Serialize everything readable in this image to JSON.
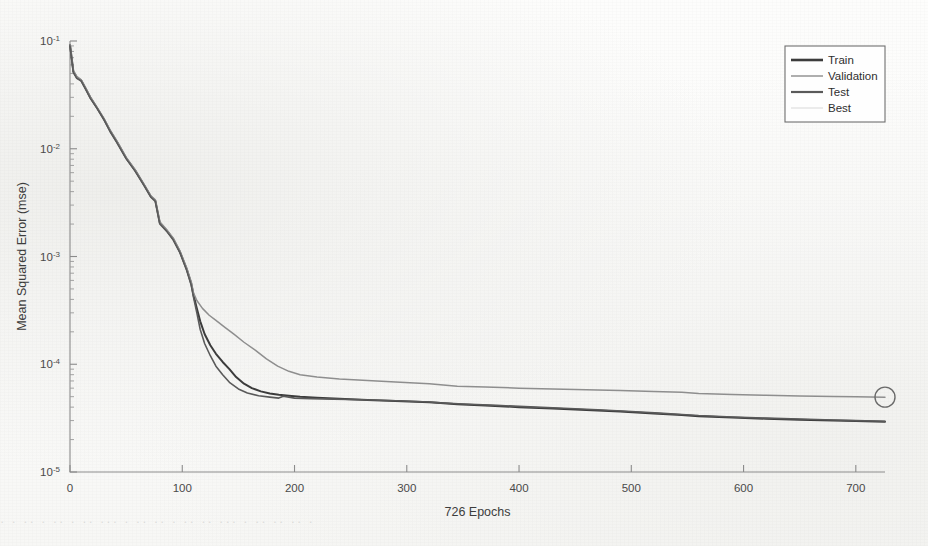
{
  "figure": {
    "kind": "training-performance-plot",
    "background_color": "#fdfdfc"
  },
  "chart_data": {
    "type": "line",
    "title": "",
    "xlabel": "726 Epochs",
    "ylabel": "Mean Squared Error  (mse)",
    "yscale": "log",
    "xscale": "linear",
    "xlim": [
      0,
      726
    ],
    "ylim": [
      1e-05,
      0.1
    ],
    "grid": false,
    "legend_position": "top-right",
    "xticks": [
      0,
      100,
      200,
      300,
      400,
      500,
      600,
      700
    ],
    "xticklabels": [
      "0",
      "100",
      "200",
      "300",
      "400",
      "500",
      "600",
      "700"
    ],
    "yticks": [
      1e-05,
      0.0001,
      0.001,
      0.01,
      0.1
    ],
    "yticklabels": [
      "10-5",
      "10-4",
      "10-3",
      "10-2",
      "10-1"
    ],
    "ytick_mantissas": [
      "10",
      "10",
      "10",
      "10",
      "10"
    ],
    "ytick_exponents": [
      "-5",
      "-4",
      "-3",
      "-2",
      "-1"
    ],
    "series": [
      {
        "name": "Train",
        "color": "#3c3c3c",
        "width": 2.0,
        "x": [
          0,
          3,
          6,
          10,
          14,
          18,
          24,
          30,
          36,
          42,
          50,
          58,
          66,
          72,
          76,
          80,
          86,
          92,
          98,
          104,
          108,
          110,
          113,
          116,
          120,
          125,
          130,
          136,
          142,
          148,
          155,
          162,
          170,
          178,
          186,
          195,
          205,
          220,
          240,
          265,
          290,
          320,
          330,
          345,
          370,
          400,
          430,
          460,
          490,
          520,
          545,
          560,
          590,
          620,
          650,
          680,
          700,
          726
        ],
        "y": [
          0.092,
          0.052,
          0.046,
          0.043,
          0.036,
          0.03,
          0.024,
          0.019,
          0.0145,
          0.0115,
          0.0082,
          0.0063,
          0.0046,
          0.0036,
          0.0033,
          0.00205,
          0.00175,
          0.00145,
          0.0011,
          0.00076,
          0.00056,
          0.00044,
          0.00033,
          0.00025,
          0.00019,
          0.00015,
          0.000125,
          0.000105,
          9e-05,
          7.6e-05,
          6.6e-05,
          6e-05,
          5.6e-05,
          5.35e-05,
          5.2e-05,
          5.1e-05,
          5e-05,
          4.9e-05,
          4.78e-05,
          4.66e-05,
          4.56e-05,
          4.45e-05,
          4.36e-05,
          4.26e-05,
          4.14e-05,
          4e-05,
          3.88e-05,
          3.76e-05,
          3.64e-05,
          3.5e-05,
          3.38e-05,
          3.3e-05,
          3.2e-05,
          3.12e-05,
          3.06e-05,
          3e-05,
          2.97e-05,
          2.93e-05
        ]
      },
      {
        "name": "Validation",
        "color": "#8e8e8e",
        "width": 1.5,
        "x": [
          0,
          3,
          6,
          10,
          14,
          18,
          24,
          30,
          36,
          42,
          50,
          58,
          66,
          72,
          76,
          80,
          86,
          92,
          98,
          104,
          108,
          110,
          113,
          118,
          124,
          130,
          138,
          146,
          155,
          165,
          175,
          185,
          195,
          205,
          220,
          240,
          265,
          290,
          320,
          330,
          345,
          370,
          400,
          430,
          460,
          490,
          520,
          545,
          560,
          590,
          620,
          650,
          680,
          700,
          726
        ],
        "y": [
          0.093,
          0.053,
          0.047,
          0.0435,
          0.0365,
          0.0305,
          0.0242,
          0.0192,
          0.0147,
          0.0117,
          0.0083,
          0.0064,
          0.00465,
          0.00365,
          0.00335,
          0.0021,
          0.00178,
          0.00148,
          0.00112,
          0.00078,
          0.00058,
          0.00046,
          0.00039,
          0.00033,
          0.000285,
          0.000255,
          0.00022,
          0.00019,
          0.00016,
          0.000135,
          0.000112,
          9.6e-05,
          8.6e-05,
          8e-05,
          7.6e-05,
          7.3e-05,
          7.05e-05,
          6.85e-05,
          6.6e-05,
          6.45e-05,
          6.25e-05,
          6.15e-05,
          6e-05,
          5.9e-05,
          5.8e-05,
          5.7e-05,
          5.6e-05,
          5.5e-05,
          5.35e-05,
          5.25e-05,
          5.15e-05,
          5.08e-05,
          5.03e-05,
          5e-05,
          4.95e-05
        ]
      },
      {
        "name": "Test",
        "color": "#5a5a5a",
        "width": 1.6,
        "x": [
          0,
          3,
          6,
          10,
          14,
          18,
          24,
          30,
          36,
          42,
          50,
          58,
          66,
          72,
          76,
          80,
          86,
          92,
          98,
          104,
          108,
          110,
          113,
          116,
          120,
          125,
          130,
          136,
          142,
          150,
          158,
          168,
          178,
          186,
          190,
          200,
          215,
          235,
          260,
          290,
          320,
          330,
          350,
          380,
          410,
          440,
          470,
          500,
          525,
          545,
          560,
          590,
          620,
          650,
          680,
          700,
          726
        ],
        "y": [
          0.09,
          0.051,
          0.045,
          0.0425,
          0.0355,
          0.0295,
          0.0238,
          0.0188,
          0.0143,
          0.0113,
          0.0081,
          0.0062,
          0.00455,
          0.00355,
          0.00325,
          0.002,
          0.00172,
          0.00142,
          0.00108,
          0.00074,
          0.00054,
          0.00042,
          0.0003,
          0.00021,
          0.000155,
          0.00012,
          9.6e-05,
          8e-05,
          6.8e-05,
          5.9e-05,
          5.4e-05,
          5.1e-05,
          4.95e-05,
          4.85e-05,
          5.05e-05,
          4.85e-05,
          4.8e-05,
          4.75e-05,
          4.68e-05,
          4.58e-05,
          4.46e-05,
          4.38e-05,
          4.28e-05,
          4.15e-05,
          4.02e-05,
          3.9e-05,
          3.78e-05,
          3.64e-05,
          3.52e-05,
          3.42e-05,
          3.34e-05,
          3.24e-05,
          3.16e-05,
          3.1e-05,
          3.04e-05,
          3e-05,
          2.96e-05
        ]
      },
      {
        "name": "Best",
        "color": "#6a6a6a",
        "width": 1.2,
        "marker": "circle",
        "best_epoch": 726,
        "best_value": 4.95e-05,
        "x": [],
        "y": []
      }
    ]
  },
  "legend": {
    "entries": [
      {
        "label": "Train",
        "color": "#3c3c3c",
        "width": 2.6
      },
      {
        "label": "Validation",
        "color": "#9a9a9a",
        "width": 1.6
      },
      {
        "label": "Test",
        "color": "#5a5a5a",
        "width": 2.2
      },
      {
        "label": "Best",
        "color": "#d8d8d8",
        "width": 1.0
      }
    ]
  },
  "page_bleed_text": "· ·  ·· ·   ·· ·  ·· ··· ·  ·· ·· ·   ·· ·· ···  · ·· ·· ·· ·"
}
